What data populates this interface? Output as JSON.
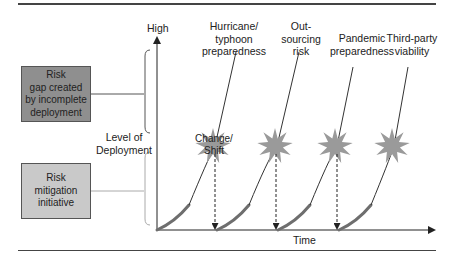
{
  "axes": {
    "y_top_label": "High",
    "y_axis_label_lines": [
      "Level of",
      "Deployment"
    ],
    "x_axis_label": "Time"
  },
  "boxes": {
    "risk_gap": {
      "lines": [
        "Risk",
        "gap created",
        "by incomplete",
        "deployment"
      ],
      "fill": "#8f8f8f"
    },
    "risk_mitigation": {
      "lines": [
        "Risk",
        "mitigation",
        "initiative"
      ],
      "fill": "#c9c9c9"
    }
  },
  "initiatives": [
    {
      "label_lines": [
        "Hurricane/",
        "typhoon",
        "preparedness"
      ]
    },
    {
      "label_lines": [
        "Out-",
        "sourcing",
        "risk"
      ]
    },
    {
      "label_lines": [
        "Pandemic",
        "preparedness"
      ]
    },
    {
      "label_lines": [
        "Third-party",
        "viability"
      ]
    }
  ],
  "event": {
    "label_lines": [
      "Change/",
      "Shift"
    ],
    "star_color": "#9a9a9a"
  },
  "colors": {
    "curve_thick": "#6e6e6e",
    "curve_thin": "#333333",
    "rule": "#444444",
    "bracket_upper": "#555555",
    "bracket_lower": "#aaaaaa"
  }
}
